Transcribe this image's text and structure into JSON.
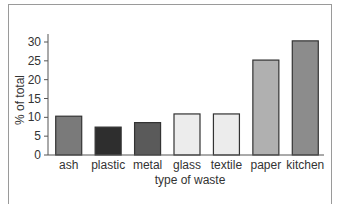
{
  "chart_data": {
    "type": "bar",
    "title": "",
    "xlabel": "type of waste",
    "ylabel": "% of total",
    "ylim": [
      0,
      30
    ],
    "yticks": [
      0,
      5,
      10,
      15,
      20,
      25,
      30
    ],
    "grid": false,
    "legend": null,
    "categories": [
      "ash",
      "plastic",
      "metal",
      "glass",
      "textile",
      "paper",
      "kitchen"
    ],
    "values": [
      10.3,
      7.4,
      8.6,
      10.9,
      10.9,
      25.2,
      30.3
    ],
    "colors": [
      "#7a7a7a",
      "#2e2e2e",
      "#5a5a5a",
      "#ececec",
      "#ececec",
      "#b0b0b0",
      "#8c8c8c"
    ]
  }
}
